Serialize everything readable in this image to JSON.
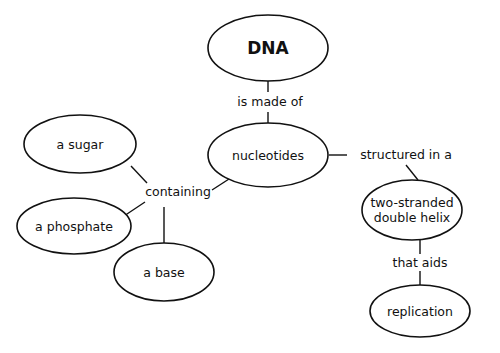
{
  "diagram": {
    "type": "concept-map",
    "background": "#ffffff",
    "stroke_color": "#111111",
    "nodes": [
      {
        "id": "dna",
        "label": [
          "DNA"
        ],
        "cx": 268,
        "cy": 48,
        "rx": 60,
        "ry": 33,
        "bold": true
      },
      {
        "id": "nucleotides",
        "label": [
          "nucleotides"
        ],
        "cx": 268,
        "cy": 155,
        "rx": 60,
        "ry": 32
      },
      {
        "id": "sugar",
        "label": [
          "a sugar"
        ],
        "cx": 80,
        "cy": 144,
        "rx": 56,
        "ry": 29
      },
      {
        "id": "phosphate",
        "label": [
          "a phosphate"
        ],
        "cx": 74,
        "cy": 226,
        "rx": 57,
        "ry": 28
      },
      {
        "id": "base",
        "label": [
          "a base"
        ],
        "cx": 164,
        "cy": 272,
        "rx": 50,
        "ry": 29
      },
      {
        "id": "helix",
        "label": [
          "two-stranded",
          "double helix"
        ],
        "cx": 412,
        "cy": 210,
        "rx": 50,
        "ry": 30
      },
      {
        "id": "replication",
        "label": [
          "replication"
        ],
        "cx": 420,
        "cy": 311,
        "rx": 50,
        "ry": 26
      }
    ],
    "links": [
      {
        "id": "is-made-of",
        "label": "is made of",
        "x": 270,
        "y": 106
      },
      {
        "id": "containing",
        "label": "containing",
        "x": 178,
        "y": 196
      },
      {
        "id": "structured-in-a",
        "label": "structured in a",
        "x": 406,
        "y": 159
      },
      {
        "id": "that-aids",
        "label": "that aids",
        "x": 420,
        "y": 267
      }
    ],
    "edges": [
      {
        "from": "dna",
        "to": "is-made-of",
        "x1": 268,
        "y1": 81,
        "x2": 268,
        "y2": 92
      },
      {
        "from": "is-made-of",
        "to": "nucleotides",
        "x1": 268,
        "y1": 112,
        "x2": 268,
        "y2": 123
      },
      {
        "from": "nucleotides",
        "to": "structured-in-a",
        "x1": 329,
        "y1": 155,
        "x2": 347,
        "y2": 155
      },
      {
        "from": "structured-in-a",
        "to": "helix",
        "x1": 406,
        "y1": 165,
        "x2": 418,
        "y2": 180
      },
      {
        "from": "helix",
        "to": "that-aids",
        "x1": 420,
        "y1": 240,
        "x2": 420,
        "y2": 254
      },
      {
        "from": "that-aids",
        "to": "replication",
        "x1": 420,
        "y1": 271,
        "x2": 420,
        "y2": 285
      },
      {
        "from": "nucleotides",
        "to": "containing",
        "x1": 229,
        "y1": 179,
        "x2": 212,
        "y2": 190
      },
      {
        "from": "sugar",
        "to": "containing",
        "x1": 131,
        "y1": 166,
        "x2": 147,
        "y2": 183
      },
      {
        "from": "phosphate",
        "to": "containing",
        "x1": 121,
        "y1": 218,
        "x2": 145,
        "y2": 202
      },
      {
        "from": "containing",
        "to": "base",
        "x1": 164,
        "y1": 207,
        "x2": 164,
        "y2": 243
      }
    ]
  }
}
